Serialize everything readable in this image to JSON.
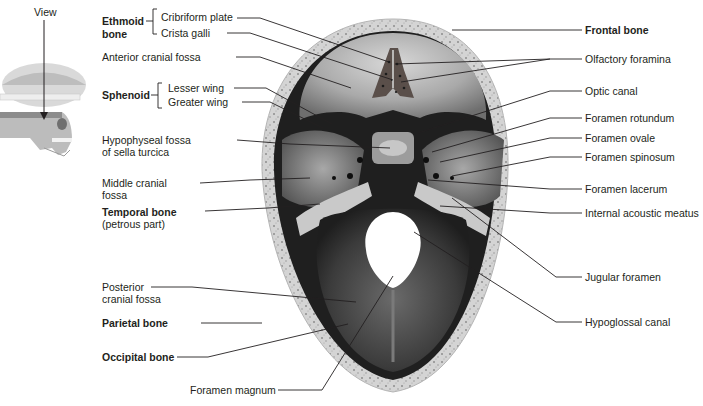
{
  "figure": {
    "inset": {
      "view_label": "View"
    }
  },
  "labels_left": {
    "ethmoid": {
      "group": "Ethmoid\nbone",
      "group_line1": "Ethmoid",
      "group_line2": "bone",
      "items": [
        "Cribriform plate",
        "Crista galli"
      ]
    },
    "anterior_cranial_fossa": "Anterior cranial fossa",
    "sphenoid": {
      "group": "Sphenoid",
      "items": [
        "Lesser wing",
        "Greater wing"
      ]
    },
    "hypophyseal_fossa": {
      "line1": "Hypophyseal fossa",
      "line2": "of sella turcica"
    },
    "middle_cranial_fossa": {
      "line1": "Middle cranial",
      "line2": "fossa"
    },
    "temporal_bone": {
      "line1": "Temporal bone",
      "line2": "(petrous part)"
    },
    "posterior_cranial_fossa": {
      "line1": "Posterior",
      "line2": "cranial fossa"
    },
    "parietal_bone": "Parietal bone",
    "occipital_bone": "Occipital bone",
    "foramen_magnum": "Foramen magnum"
  },
  "labels_right": {
    "frontal_bone": "Frontal bone",
    "olfactory_foramina": "Olfactory foramina",
    "optic_canal": "Optic canal",
    "foramen_rotundum": "Foramen rotundum",
    "foramen_ovale": "Foramen ovale",
    "foramen_spinosum": "Foramen spinosum",
    "foramen_lacerum": "Foramen lacerum",
    "internal_acoustic_meatus": "Internal acoustic meatus",
    "jugular_foramen": "Jugular foramen",
    "hypoglossal_canal": "Hypoglossal canal"
  },
  "colors": {
    "bone_rim": "#cfcfcf",
    "bone_rim_speckle": "#8a8a8a",
    "fossa_light": "#b9b9b9",
    "fossa_dark": "#2a2a2a",
    "leader_line": "#231f20",
    "text": "#231f20"
  }
}
